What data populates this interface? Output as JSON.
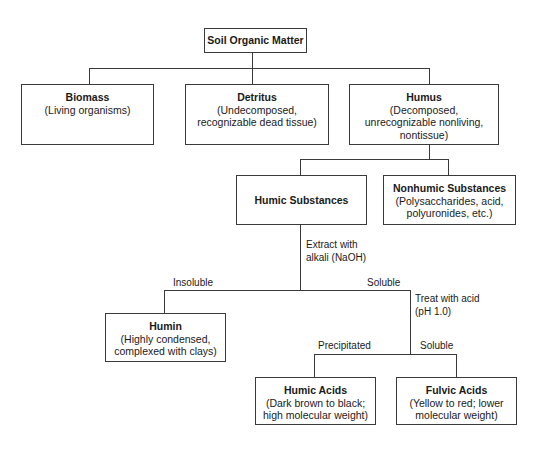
{
  "diagram": {
    "root": {
      "title": "Soil Organic Matter"
    },
    "level1": [
      {
        "title": "Biomass",
        "desc": "(Living organisms)"
      },
      {
        "title": "Detritus",
        "desc": "(Undecomposed,\nrecognizable dead tissue)"
      },
      {
        "title": "Humus",
        "desc": "(Decomposed,\nunrecognizable nonliving,\nnontissue)"
      }
    ],
    "level2": [
      {
        "title": "Humic Substances"
      },
      {
        "title": "Nonhumic Substances",
        "desc": "(Polysaccharides, acid,\npolyuronides, etc.)"
      }
    ],
    "edge_labels": {
      "extract": "Extract with\nalkali (NaOH)",
      "insoluble": "Insoluble",
      "soluble_1": "Soluble",
      "treat": "Treat with acid\n(pH 1.0)",
      "precipitated": "Precipitated",
      "soluble_2": "Soluble"
    },
    "level3": [
      {
        "title": "Humin",
        "desc": "(Highly condensed,\ncomplexed with clays)"
      }
    ],
    "level4": [
      {
        "title": "Humic Acids",
        "desc": "(Dark brown to black;\nhigh molecular weight)"
      },
      {
        "title": "Fulvic Acids",
        "desc": "(Yellow to red; lower\nmolecular weight)"
      }
    ]
  }
}
